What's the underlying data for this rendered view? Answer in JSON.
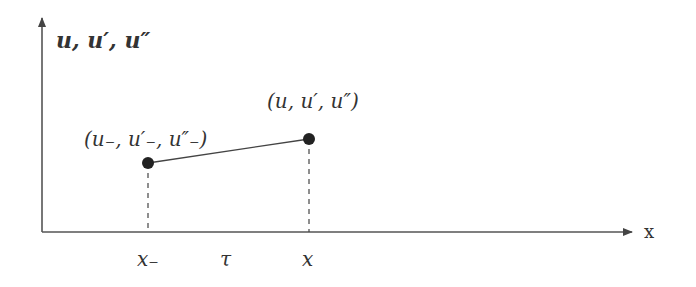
{
  "diagram": {
    "y_axis_label": "u, u′, u″",
    "x_axis_label": "x",
    "points": [
      {
        "id": "left",
        "label": "(u₋, u′₋, u″₋)",
        "x_label": "x₋"
      },
      {
        "id": "right",
        "label": "(u, u′, u″)",
        "x_label": "x"
      }
    ],
    "interval_label": "τ",
    "colors": {
      "stroke": "#333333",
      "point": "#222222"
    }
  }
}
